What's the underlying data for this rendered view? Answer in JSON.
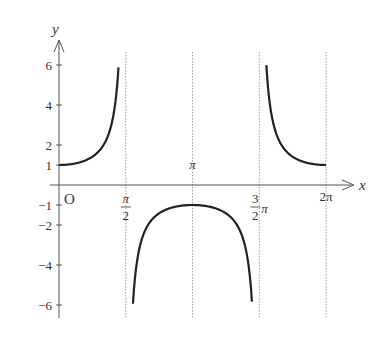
{
  "chart_data": {
    "type": "line",
    "function": "y = 1/cos(x) (secant)",
    "title": "",
    "xlabel": "x",
    "ylabel": "y",
    "origin_label": "O",
    "x_range": [
      0,
      6.2832
    ],
    "ylim": [
      -6.5,
      6.5
    ],
    "grid": false,
    "asymptotes": [
      {
        "x": 1.5708,
        "label": "π/2"
      },
      {
        "x": 3.1416,
        "label": "π"
      },
      {
        "x": 4.7124,
        "label": "3/2 π"
      },
      {
        "x": 6.2832,
        "label": "2π"
      }
    ],
    "x_ticks": [
      {
        "value": 1.5708,
        "label_num": "π",
        "label_den": "2"
      },
      {
        "value": 3.1416,
        "label": "π"
      },
      {
        "value": 4.7124,
        "label_num": "3",
        "label_den": "2",
        "label_suffix": "π"
      },
      {
        "value": 6.2832,
        "label": "2π"
      }
    ],
    "y_ticks": [
      {
        "value": 6,
        "label": "6"
      },
      {
        "value": 4,
        "label": "4"
      },
      {
        "value": 2,
        "label": "2"
      },
      {
        "value": 1,
        "label": "1"
      },
      {
        "value": -1,
        "label": "−1"
      },
      {
        "value": -2,
        "label": "−2"
      },
      {
        "value": -4,
        "label": "−4"
      },
      {
        "value": -6,
        "label": "−6"
      }
    ],
    "series": [
      {
        "name": "branch-1",
        "x": [
          0,
          0.5,
          0.8,
          1.0,
          1.2,
          1.3,
          1.4
        ],
        "y": [
          1,
          1.14,
          1.44,
          1.85,
          2.76,
          3.74,
          5.88
        ]
      },
      {
        "name": "branch-2",
        "x": [
          1.74,
          2.0,
          2.5,
          3.1416,
          3.78,
          4.28,
          4.54
        ],
        "y": [
          -5.88,
          -2.4,
          -1.25,
          -1,
          -1.25,
          -2.4,
          -5.88
        ]
      },
      {
        "name": "branch-3",
        "x": [
          4.88,
          5.0,
          5.5,
          6.0,
          6.2832
        ],
        "y": [
          5.88,
          3.53,
          1.41,
          1.04,
          1
        ]
      }
    ]
  }
}
